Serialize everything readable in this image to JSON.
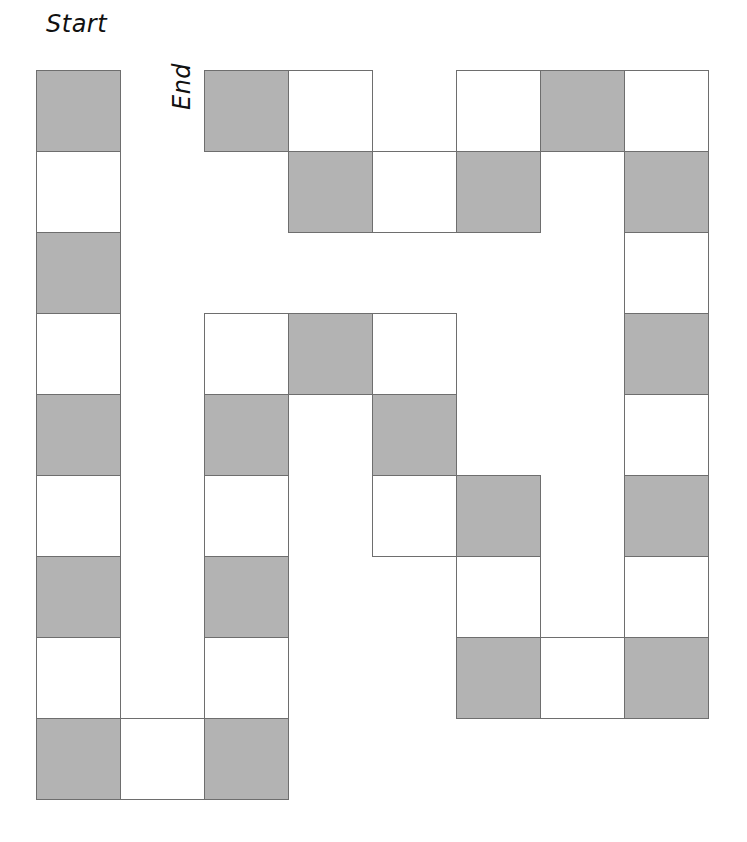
{
  "labels": {
    "start": "Start",
    "end": "End"
  },
  "colors": {
    "dark": "#b3b3b3",
    "light": "#ffffff",
    "border": "#6e6e6e"
  },
  "grid": {
    "origin_x": 36,
    "origin_y": 70,
    "cell_w": 84,
    "cell_h": 81
  },
  "path": [
    {
      "col": 0,
      "row": 0,
      "shade": "dark"
    },
    {
      "col": 0,
      "row": 1,
      "shade": "light"
    },
    {
      "col": 0,
      "row": 2,
      "shade": "dark"
    },
    {
      "col": 0,
      "row": 3,
      "shade": "light"
    },
    {
      "col": 0,
      "row": 4,
      "shade": "dark"
    },
    {
      "col": 0,
      "row": 5,
      "shade": "light"
    },
    {
      "col": 0,
      "row": 6,
      "shade": "dark"
    },
    {
      "col": 0,
      "row": 7,
      "shade": "light"
    },
    {
      "col": 0,
      "row": 8,
      "shade": "dark"
    },
    {
      "col": 1,
      "row": 8,
      "shade": "light"
    },
    {
      "col": 2,
      "row": 8,
      "shade": "dark"
    },
    {
      "col": 2,
      "row": 7,
      "shade": "light"
    },
    {
      "col": 2,
      "row": 6,
      "shade": "dark"
    },
    {
      "col": 2,
      "row": 5,
      "shade": "light"
    },
    {
      "col": 2,
      "row": 4,
      "shade": "dark"
    },
    {
      "col": 2,
      "row": 3,
      "shade": "light"
    },
    {
      "col": 3,
      "row": 3,
      "shade": "dark"
    },
    {
      "col": 4,
      "row": 3,
      "shade": "light"
    },
    {
      "col": 4,
      "row": 4,
      "shade": "dark"
    },
    {
      "col": 4,
      "row": 5,
      "shade": "light"
    },
    {
      "col": 5,
      "row": 5,
      "shade": "dark"
    },
    {
      "col": 5,
      "row": 6,
      "shade": "light"
    },
    {
      "col": 5,
      "row": 7,
      "shade": "dark"
    },
    {
      "col": 6,
      "row": 7,
      "shade": "light"
    },
    {
      "col": 7,
      "row": 7,
      "shade": "dark"
    },
    {
      "col": 7,
      "row": 6,
      "shade": "light"
    },
    {
      "col": 7,
      "row": 5,
      "shade": "dark"
    },
    {
      "col": 7,
      "row": 4,
      "shade": "light"
    },
    {
      "col": 7,
      "row": 3,
      "shade": "dark"
    },
    {
      "col": 7,
      "row": 2,
      "shade": "light"
    },
    {
      "col": 7,
      "row": 1,
      "shade": "dark"
    },
    {
      "col": 7,
      "row": 0,
      "shade": "light"
    },
    {
      "col": 6,
      "row": 0,
      "shade": "dark"
    },
    {
      "col": 5,
      "row": 0,
      "shade": "light"
    },
    {
      "col": 5,
      "row": 1,
      "shade": "dark"
    },
    {
      "col": 4,
      "row": 1,
      "shade": "light"
    },
    {
      "col": 3,
      "row": 1,
      "shade": "dark"
    },
    {
      "col": 3,
      "row": 0,
      "shade": "light"
    },
    {
      "col": 2,
      "row": 0,
      "shade": "dark"
    }
  ]
}
